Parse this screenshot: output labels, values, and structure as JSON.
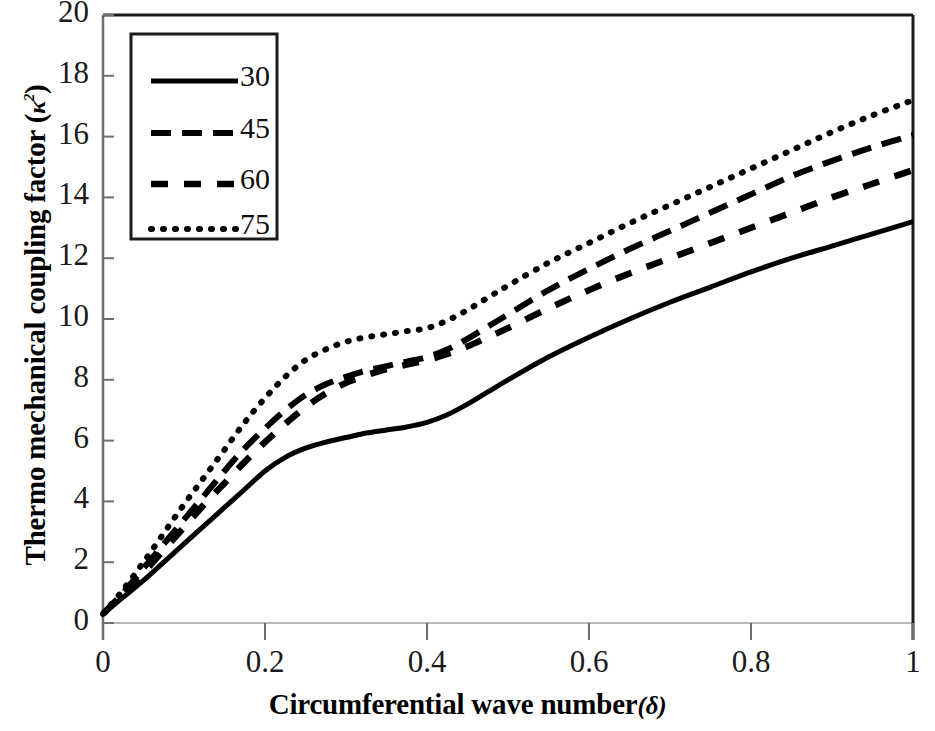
{
  "chart_data": {
    "type": "line",
    "title": "",
    "xlabel": "Circumferential wave number (δ)",
    "xlabel_text": "Circumferential wave number",
    "xlabel_symbol": "(δ)",
    "ylabel": "Thermo mechanical coupling factor (κ²)",
    "ylabel_text": "Thermo mechanical coupling factor",
    "ylabel_symbol": "κ",
    "ylabel_symbol_sup": "2",
    "xlim": [
      0,
      1
    ],
    "ylim": [
      0,
      20
    ],
    "xticks": [
      0,
      0.2,
      0.4,
      0.6,
      0.8,
      1
    ],
    "xtick_labels": [
      "0",
      "0.2",
      "0.4",
      "0.6",
      "0.8",
      "1"
    ],
    "yticks": [
      0,
      2,
      4,
      6,
      8,
      10,
      12,
      14,
      16,
      18,
      20
    ],
    "ytick_labels": [
      "0",
      "2",
      "4",
      "6",
      "8",
      "10",
      "12",
      "14",
      "16",
      "18",
      "20"
    ],
    "grid": false,
    "legend_position": "top-left",
    "legend_title": "",
    "line_color": "#000000",
    "series": [
      {
        "name": "30",
        "label": "30",
        "style": "solid",
        "x": [
          0,
          0.025,
          0.05,
          0.075,
          0.1,
          0.125,
          0.15,
          0.175,
          0.2,
          0.225,
          0.25,
          0.275,
          0.3,
          0.325,
          0.35,
          0.375,
          0.4,
          0.425,
          0.45,
          0.475,
          0.5,
          0.55,
          0.6,
          0.65,
          0.7,
          0.75,
          0.8,
          0.85,
          0.9,
          0.95,
          1
        ],
        "y": [
          0.3,
          0.85,
          1.4,
          2.0,
          2.6,
          3.2,
          3.8,
          4.4,
          5.0,
          5.45,
          5.75,
          5.95,
          6.1,
          6.25,
          6.35,
          6.45,
          6.6,
          6.85,
          7.2,
          7.6,
          8.0,
          8.75,
          9.4,
          10.0,
          10.55,
          11.05,
          11.55,
          12.0,
          12.4,
          12.8,
          13.2
        ]
      },
      {
        "name": "45",
        "label": "45",
        "style": "dashed-long",
        "x": [
          0,
          0.025,
          0.05,
          0.075,
          0.1,
          0.125,
          0.15,
          0.175,
          0.2,
          0.225,
          0.25,
          0.275,
          0.3,
          0.325,
          0.35,
          0.375,
          0.4,
          0.425,
          0.45,
          0.475,
          0.5,
          0.55,
          0.6,
          0.65,
          0.7,
          0.75,
          0.8,
          0.85,
          0.9,
          0.95,
          1
        ],
        "y": [
          0.3,
          1.0,
          1.8,
          2.6,
          3.4,
          4.2,
          5.0,
          5.75,
          6.4,
          7.0,
          7.5,
          7.85,
          8.1,
          8.3,
          8.45,
          8.6,
          8.75,
          9.0,
          9.35,
          9.75,
          10.15,
          10.95,
          11.65,
          12.3,
          12.9,
          13.5,
          14.1,
          14.7,
          15.2,
          15.65,
          16.05
        ]
      },
      {
        "name": "60",
        "label": "60",
        "style": "dashed-medium",
        "x": [
          0,
          0.025,
          0.05,
          0.075,
          0.1,
          0.125,
          0.15,
          0.175,
          0.2,
          0.225,
          0.25,
          0.275,
          0.3,
          0.325,
          0.35,
          0.375,
          0.4,
          0.425,
          0.45,
          0.475,
          0.5,
          0.55,
          0.6,
          0.65,
          0.7,
          0.75,
          0.8,
          0.85,
          0.9,
          0.95,
          1
        ],
        "y": [
          0.3,
          0.95,
          1.65,
          2.4,
          3.15,
          3.9,
          4.6,
          5.3,
          5.95,
          6.55,
          7.1,
          7.55,
          7.9,
          8.15,
          8.35,
          8.5,
          8.65,
          8.85,
          9.1,
          9.4,
          9.7,
          10.35,
          10.95,
          11.5,
          12.0,
          12.5,
          13.0,
          13.5,
          14.0,
          14.45,
          14.9
        ]
      },
      {
        "name": "75",
        "label": "75",
        "style": "dotted",
        "x": [
          0,
          0.025,
          0.05,
          0.075,
          0.1,
          0.125,
          0.15,
          0.175,
          0.2,
          0.225,
          0.25,
          0.275,
          0.3,
          0.325,
          0.35,
          0.375,
          0.4,
          0.425,
          0.45,
          0.475,
          0.5,
          0.55,
          0.6,
          0.65,
          0.7,
          0.75,
          0.8,
          0.85,
          0.9,
          0.95,
          1
        ],
        "y": [
          0.3,
          1.1,
          2.0,
          2.95,
          3.9,
          4.8,
          5.7,
          6.6,
          7.4,
          8.1,
          8.65,
          9.0,
          9.25,
          9.4,
          9.5,
          9.6,
          9.7,
          9.95,
          10.3,
          10.7,
          11.1,
          11.85,
          12.5,
          13.15,
          13.75,
          14.35,
          14.95,
          15.55,
          16.15,
          16.7,
          17.2
        ]
      }
    ]
  },
  "legend": {
    "entries": [
      {
        "label": "30",
        "style": "solid"
      },
      {
        "label": "45",
        "style": "dashed-long"
      },
      {
        "label": "60",
        "style": "dashed-medium"
      },
      {
        "label": "75",
        "style": "dotted"
      }
    ]
  }
}
